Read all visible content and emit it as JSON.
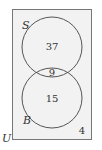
{
  "diagram": {
    "type": "venn",
    "universe_label": "U",
    "sets": [
      {
        "label": "S",
        "only_count": "37"
      },
      {
        "label": "B",
        "only_count": "15"
      }
    ],
    "intersection_count": "9",
    "outside_count": "4"
  },
  "colors": {
    "background": "#f2f2f2",
    "stroke": "#555555"
  }
}
